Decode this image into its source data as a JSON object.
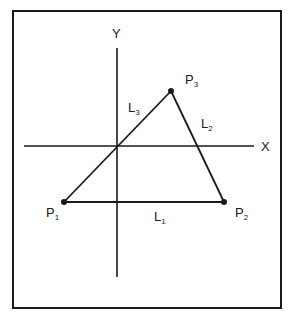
{
  "diagram": {
    "colors": {
      "line": "#1a1a1a",
      "background": "#ffffff"
    },
    "axes": {
      "x_label": "X",
      "y_label": "Y"
    },
    "points": [
      {
        "id": "P1",
        "label": "P",
        "sub": "1"
      },
      {
        "id": "P2",
        "label": "P",
        "sub": "2"
      },
      {
        "id": "P3",
        "label": "P",
        "sub": "3"
      }
    ],
    "lines": [
      {
        "id": "L1",
        "label": "L",
        "sub": "1",
        "from": "P1",
        "to": "P2"
      },
      {
        "id": "L2",
        "label": "L",
        "sub": "2",
        "from": "P2",
        "to": "P3"
      },
      {
        "id": "L3",
        "label": "L",
        "sub": "3",
        "from": "P3",
        "to": "P1"
      }
    ]
  }
}
